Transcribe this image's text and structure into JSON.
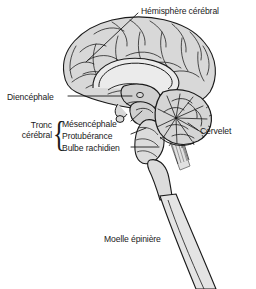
{
  "figure": {
    "language": "fr",
    "background_color": "#ffffff",
    "outline_color": "#1a1a1a",
    "fill_color": "#d8d8d8",
    "fill_color_dark": "#b9b9b9",
    "fill_color_light": "#ebebeb"
  },
  "labels": {
    "hemisphere": "Hémisphère cérébral",
    "diencephale": "Diencéphale",
    "tronc_cerebral": "Tronc cérébral",
    "mesencephale": "Mésencéphale",
    "protuberance": "Protubérance",
    "bulbe_rachidien": "Bulbe rachidien",
    "cervelet": "Cervelet",
    "moelle_epiniere": "Moelle épinière",
    "brace": "{"
  },
  "structures": [
    {
      "name": "hemisphere-cerebral",
      "label": "Hémisphère cérébral"
    },
    {
      "name": "diencephale",
      "label": "Diencéphale"
    },
    {
      "name": "mesencephale",
      "label": "Mésencéphale"
    },
    {
      "name": "protuberance",
      "label": "Protubérance"
    },
    {
      "name": "bulbe-rachidien",
      "label": "Bulbe rachidien"
    },
    {
      "name": "cervelet",
      "label": "Cervelet"
    },
    {
      "name": "moelle-epiniere",
      "label": "Moelle épinière"
    }
  ]
}
